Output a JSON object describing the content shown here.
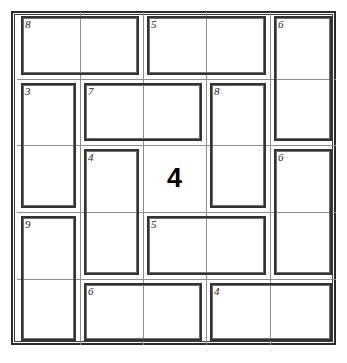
{
  "puzzle": {
    "type": "killer-sudoku",
    "title": "Killer Sudoku 5x5",
    "grid_size": 5,
    "columns": 5,
    "rows": 5,
    "colors": {
      "frame": "#2b2b2b",
      "gridline": "#8d8d8d",
      "cage_border": "#333333",
      "cage_sum_text": "#1a1a1a",
      "given_text": "#000000",
      "background": "#ffffff"
    },
    "cages": [
      {
        "id": "cage-8-r0c0",
        "sum": "8",
        "cells": [
          [
            0,
            0
          ],
          [
            0,
            1
          ]
        ],
        "orientation": "horizontal"
      },
      {
        "id": "cage-5-r0c2",
        "sum": "5",
        "cells": [
          [
            0,
            2
          ],
          [
            0,
            3
          ]
        ],
        "orientation": "horizontal"
      },
      {
        "id": "cage-6-r0c4",
        "sum": "6",
        "cells": [
          [
            0,
            4
          ],
          [
            1,
            4
          ]
        ],
        "orientation": "vertical"
      },
      {
        "id": "cage-3-r1c0",
        "sum": "3",
        "cells": [
          [
            1,
            0
          ],
          [
            2,
            0
          ]
        ],
        "orientation": "vertical"
      },
      {
        "id": "cage-7-r1c1",
        "sum": "7",
        "cells": [
          [
            1,
            1
          ],
          [
            1,
            2
          ]
        ],
        "orientation": "horizontal"
      },
      {
        "id": "cage-8-r1c3",
        "sum": "8",
        "cells": [
          [
            1,
            3
          ],
          [
            2,
            3
          ]
        ],
        "orientation": "vertical"
      },
      {
        "id": "cage-4-r2c1",
        "sum": "4",
        "cells": [
          [
            2,
            1
          ],
          [
            3,
            1
          ]
        ],
        "orientation": "vertical"
      },
      {
        "id": "cage-6-r2c4",
        "sum": "6",
        "cells": [
          [
            2,
            4
          ],
          [
            3,
            4
          ]
        ],
        "orientation": "vertical"
      },
      {
        "id": "cage-9-r3c0",
        "sum": "9",
        "cells": [
          [
            3,
            0
          ],
          [
            4,
            0
          ]
        ],
        "orientation": "vertical"
      },
      {
        "id": "cage-5-r3c2",
        "sum": "5",
        "cells": [
          [
            3,
            2
          ],
          [
            3,
            3
          ]
        ],
        "orientation": "horizontal"
      },
      {
        "id": "cage-6-r4c1",
        "sum": "6",
        "cells": [
          [
            4,
            1
          ],
          [
            4,
            2
          ]
        ],
        "orientation": "horizontal"
      },
      {
        "id": "cage-4-r4c3",
        "sum": "4",
        "cells": [
          [
            4,
            3
          ],
          [
            4,
            4
          ]
        ],
        "orientation": "horizontal"
      }
    ],
    "cage_sums": [
      "8",
      "5",
      "6",
      "3",
      "7",
      "8",
      "4",
      "6",
      "9",
      "5",
      "6",
      "4"
    ],
    "givens": [
      {
        "id": "given-r2c2",
        "row": 2,
        "col": 2,
        "value": "4"
      }
    ]
  }
}
